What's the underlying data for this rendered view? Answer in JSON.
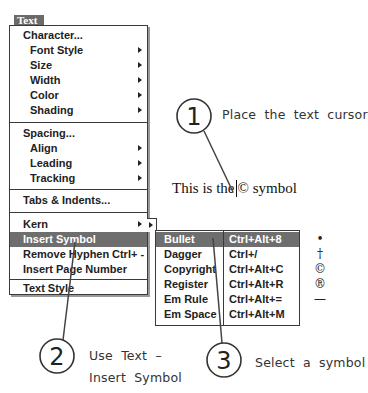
{
  "menu": {
    "title": "Text",
    "title_underline_index": 0,
    "items": [
      {
        "label": "Character...",
        "indent": false,
        "submenu": false
      },
      {
        "label": "Font Style",
        "indent": true,
        "submenu": true
      },
      {
        "label": "Size",
        "indent": true,
        "submenu": true
      },
      {
        "label": "Width",
        "indent": true,
        "submenu": true
      },
      {
        "label": "Color",
        "indent": true,
        "submenu": true
      },
      {
        "label": "Shading",
        "indent": true,
        "submenu": true
      },
      {
        "label": "Spacing...",
        "indent": false,
        "submenu": false
      },
      {
        "label": "Align",
        "indent": true,
        "submenu": true
      },
      {
        "label": "Leading",
        "indent": true,
        "submenu": true
      },
      {
        "label": "Tracking",
        "indent": true,
        "submenu": true
      },
      {
        "label": "Tabs & Indents...",
        "indent": false,
        "submenu": false
      },
      {
        "label": "Kern",
        "indent": false,
        "submenu": true
      },
      {
        "label": "Insert Symbol",
        "indent": false,
        "submenu": false,
        "highlighted": true
      },
      {
        "label": "Remove Hyphen",
        "indent": false,
        "submenu": false,
        "shortcut": "Ctrl+ -"
      },
      {
        "label": "Insert Page Number",
        "indent": false,
        "submenu": false
      },
      {
        "label": "Text Style",
        "indent": false,
        "submenu": false
      }
    ]
  },
  "symbol_submenu": {
    "items": [
      {
        "name": "Bullet",
        "shortcut": "Ctrl+Alt+8",
        "glyph": "•",
        "highlighted": true
      },
      {
        "name": "Dagger",
        "shortcut": "Ctrl+/",
        "glyph": "†"
      },
      {
        "name": "Copyright",
        "shortcut": "Ctrl+Alt+C",
        "glyph": "©"
      },
      {
        "name": "Register",
        "shortcut": "Ctrl+Alt+R",
        "glyph": "®"
      },
      {
        "name": "Em Rule",
        "shortcut": "Ctrl+Alt+=",
        "glyph": "—"
      },
      {
        "name": "Em Space",
        "shortcut": "Ctrl+Alt+M",
        "glyph": ""
      }
    ]
  },
  "sample_text": {
    "before": "This is the",
    "after": "© symbol"
  },
  "callouts": [
    {
      "number": "1",
      "text_lines": [
        "Place the text cursor"
      ]
    },
    {
      "number": "2",
      "text_lines": [
        "Use Text –",
        "Insert Symbol"
      ]
    },
    {
      "number": "3",
      "text_lines": [
        "Select a symbol"
      ]
    }
  ]
}
